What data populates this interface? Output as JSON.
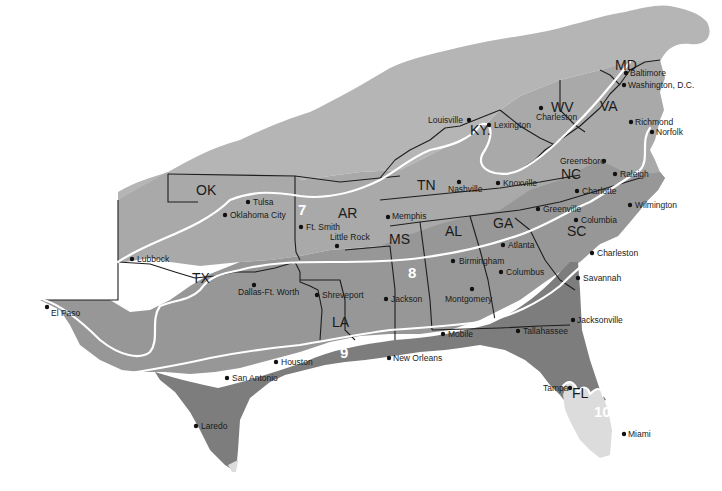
{
  "map": {
    "title": "Southeastern US Plant Hardiness Zones",
    "colors": {
      "zone6": "#b5b5b5",
      "zone7": "#a9a9a9",
      "zone8": "#979797",
      "zone9": "#7d7d7d",
      "zone10": "#dcdcdc",
      "border": "#1e1e1e",
      "zone_line": "#ffffff",
      "background": "#ffffff"
    },
    "zones": [
      {
        "id": "6",
        "label": "6"
      },
      {
        "id": "7",
        "label": "7"
      },
      {
        "id": "8",
        "label": "8"
      },
      {
        "id": "9",
        "label": "9"
      },
      {
        "id": "10",
        "label": "10"
      }
    ],
    "states": [
      {
        "abbr": "OK"
      },
      {
        "abbr": "AR"
      },
      {
        "abbr": "TX"
      },
      {
        "abbr": "LA"
      },
      {
        "abbr": "MS"
      },
      {
        "abbr": "TN"
      },
      {
        "abbr": "KY."
      },
      {
        "abbr": "AL"
      },
      {
        "abbr": "GA"
      },
      {
        "abbr": "SC"
      },
      {
        "abbr": "NC"
      },
      {
        "abbr": "WV"
      },
      {
        "abbr": "VA"
      },
      {
        "abbr": "MD"
      },
      {
        "abbr": "FL"
      }
    ],
    "cities": [
      {
        "name": "Baltimore"
      },
      {
        "name": "Washington, D.C."
      },
      {
        "name": "Richmond"
      },
      {
        "name": "Norfolk"
      },
      {
        "name": "Louisville"
      },
      {
        "name": "Lexington"
      },
      {
        "name": "Charleston"
      },
      {
        "name": "Greensboro"
      },
      {
        "name": "Raleigh"
      },
      {
        "name": "Nashville"
      },
      {
        "name": "Knoxville"
      },
      {
        "name": "Charlotte"
      },
      {
        "name": "Wilmington"
      },
      {
        "name": "Tulsa"
      },
      {
        "name": "Oklahoma City"
      },
      {
        "name": "Ft. Smith"
      },
      {
        "name": "Little Rock"
      },
      {
        "name": "Memphis"
      },
      {
        "name": "Greenville"
      },
      {
        "name": "Columbia"
      },
      {
        "name": "Atlanta"
      },
      {
        "name": "Charleston"
      },
      {
        "name": "Lubbock"
      },
      {
        "name": "Birmingham"
      },
      {
        "name": "Columbus"
      },
      {
        "name": "Savannah"
      },
      {
        "name": "Dallas-Ft. Worth"
      },
      {
        "name": "Shreveport"
      },
      {
        "name": "Jackson"
      },
      {
        "name": "Montgomery"
      },
      {
        "name": "El Paso"
      },
      {
        "name": "Jacksonville"
      },
      {
        "name": "Mobile"
      },
      {
        "name": "Tallahassee"
      },
      {
        "name": "Houston"
      },
      {
        "name": "New Orleans"
      },
      {
        "name": "San Antonio"
      },
      {
        "name": "Tampa"
      },
      {
        "name": "Laredo"
      },
      {
        "name": "Miami"
      }
    ]
  }
}
